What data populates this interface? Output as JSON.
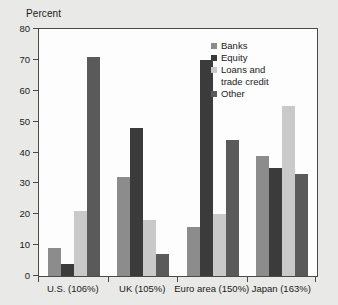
{
  "chart_data": {
    "type": "bar",
    "title": "",
    "subtitle": "",
    "xlabel": "",
    "ylabel": "Percent",
    "ylim": [
      0,
      80
    ],
    "yticks": [
      0,
      10,
      20,
      30,
      40,
      50,
      60,
      70,
      80
    ],
    "ytick_labels": [
      "0",
      "10",
      "20",
      "30",
      "40",
      "50",
      "60",
      "70",
      "80"
    ],
    "grid": false,
    "legend_position": "top-right",
    "categories": [
      "U.S. (106%)",
      "UK (105%)",
      "Euro area (150%)",
      "Japan (163%)"
    ],
    "series": [
      {
        "name": "Banks",
        "color": "#8c8c8c",
        "values": [
          9,
          32,
          16,
          39
        ]
      },
      {
        "name": "Equity",
        "color": "#3b3b3b",
        "values": [
          4,
          48,
          70,
          35
        ]
      },
      {
        "name": "Loans and trade credit",
        "color": "#c9c9c9",
        "values": [
          21,
          18,
          20,
          55
        ]
      },
      {
        "name": "Other",
        "color": "#5a5a5a",
        "values": [
          71,
          7,
          44,
          33
        ]
      }
    ]
  },
  "legend": {
    "entries": [
      {
        "label": "Banks"
      },
      {
        "label": "Equity"
      },
      {
        "label": "Loans and",
        "label_cont": "trade credit"
      },
      {
        "label": "Other"
      }
    ]
  },
  "colors": {
    "banks": "#8c8c8c",
    "equity": "#3b3b3b",
    "loans": "#c9c9c9",
    "other": "#5a5a5a",
    "axis": "#4a4a4a",
    "plot_background": "#fdfdfd",
    "page_background": "#e9e9e7"
  }
}
